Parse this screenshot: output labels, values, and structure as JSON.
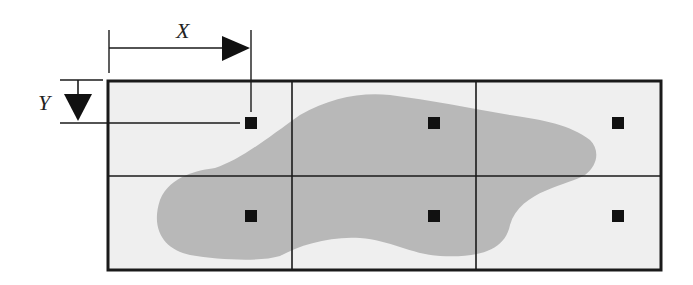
{
  "diagram": {
    "labels": {
      "x": "X",
      "y": "Y"
    },
    "colors": {
      "background": "#ffffff",
      "cell_fill": "#efefef",
      "blob_fill": "#b8b8b8",
      "line": "#1a1a1a",
      "marker": "#111111"
    },
    "grid": {
      "rows": 2,
      "cols": 3
    },
    "cells": [
      {
        "row": 0,
        "col": 0,
        "marker": true
      },
      {
        "row": 0,
        "col": 1,
        "marker": true
      },
      {
        "row": 0,
        "col": 2,
        "marker": true
      },
      {
        "row": 1,
        "col": 0,
        "marker": true
      },
      {
        "row": 1,
        "col": 1,
        "marker": true
      },
      {
        "row": 1,
        "col": 2,
        "marker": true
      }
    ]
  }
}
